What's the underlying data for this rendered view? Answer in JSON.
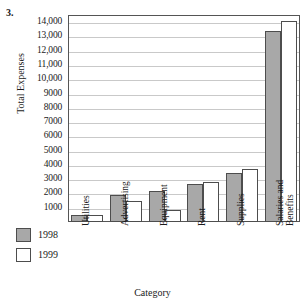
{
  "problem": {
    "number": "3."
  },
  "chart_data": {
    "type": "bar",
    "title": "",
    "xlabel": "Category",
    "ylabel": "Total Expenses",
    "categories": [
      "Utilities",
      "Advertising",
      "Equipment",
      "Rent",
      "Supplies",
      "Salaries and Benefits"
    ],
    "category_lines": [
      [
        "Utilities"
      ],
      [
        "Advertising"
      ],
      [
        "Equipment"
      ],
      [
        "Rent"
      ],
      [
        "Supplies"
      ],
      [
        "Salaries and",
        "Benefits"
      ]
    ],
    "series": [
      {
        "name": "1998",
        "color": "#a8a8a8",
        "values": [
          500,
          1900,
          2150,
          2650,
          3400,
          13400
        ]
      },
      {
        "name": "1999",
        "color": "#ffffff",
        "values": [
          500,
          1500,
          850,
          2800,
          3700,
          14050
        ]
      }
    ],
    "ylim": [
      0,
      14500
    ],
    "ytick_values": [
      1000,
      2000,
      3000,
      4000,
      5000,
      6000,
      7000,
      8000,
      9000,
      10000,
      11000,
      12000,
      13000,
      14000
    ],
    "ytick_labels": [
      "1000",
      "2000",
      "3000",
      "4000",
      "5000",
      "6000",
      "7000",
      "8000",
      "9000",
      "10,000",
      "11,000",
      "12,000",
      "13,000",
      "14,000"
    ],
    "grid": true,
    "grid_axis": "y",
    "legend_position": "bottom-left"
  },
  "legend": {
    "items": [
      {
        "label": "1998",
        "swatch": "gray-filled-square"
      },
      {
        "label": "1999",
        "swatch": "white-empty-square"
      }
    ]
  },
  "colors": {
    "series_1998": "#a8a8a8",
    "series_1999": "#ffffff",
    "bar_outline": "#4d4d4d",
    "gridline": "#c9c9c9",
    "frame": "#555555",
    "text": "#1a1a1a"
  }
}
